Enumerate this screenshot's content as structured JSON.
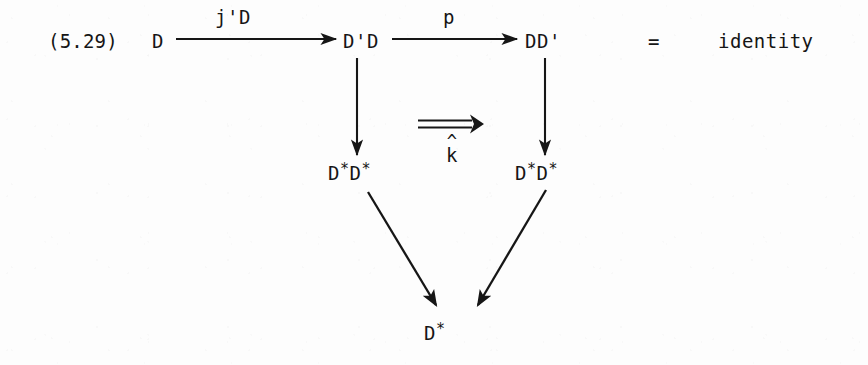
{
  "document": {
    "equation_number": "(5.29)",
    "relation_symbol": "=",
    "relation_value": "identity",
    "background_color": "#fdfdfd",
    "ink_color": "#161616"
  },
  "diagram": {
    "type": "commutative-diagram",
    "objects": [
      {
        "id": "top-left",
        "text": "D",
        "x": 152,
        "y": 43
      },
      {
        "id": "top-middle",
        "text": "D'D",
        "x": 345,
        "y": 43
      },
      {
        "id": "top-right",
        "text": "DD'",
        "x": 527,
        "y": 43
      },
      {
        "id": "middle-left",
        "text": "D",
        "star1": "*",
        "text2": "D",
        "star2": "*",
        "x": 330,
        "y": 174
      },
      {
        "id": "middle-right",
        "text": "D",
        "star1": "*",
        "text2": "D",
        "star2": "*",
        "x": 517,
        "y": 174
      },
      {
        "id": "bottom-center",
        "text": "D",
        "star1": "*",
        "x": 428,
        "y": 334
      }
    ],
    "arrow_labels": [
      {
        "id": "j-prime-D",
        "text": "j'D",
        "x": 228,
        "y": 18
      },
      {
        "id": "p",
        "text": "p",
        "x": 448,
        "y": 18
      },
      {
        "id": "k-hat",
        "hat": "^",
        "text": "k",
        "x": 448,
        "y": 152
      }
    ],
    "arrows": [
      {
        "id": "arrow-top-left-to-middle",
        "kind": "single",
        "x1": 176,
        "y1": 39,
        "x2": 337,
        "y2": 39
      },
      {
        "id": "arrow-top-middle-to-right",
        "kind": "single",
        "x1": 390,
        "y1": 39,
        "x2": 518,
        "y2": 39
      },
      {
        "id": "arrow-down-left",
        "kind": "single",
        "x1": 357,
        "y1": 58,
        "x2": 357,
        "y2": 156
      },
      {
        "id": "arrow-down-right",
        "kind": "single",
        "x1": 545,
        "y1": 58,
        "x2": 545,
        "y2": 156
      },
      {
        "id": "arrow-double-k-hat",
        "kind": "double",
        "x1": 418,
        "y1": 124,
        "x2": 480,
        "y2": 124
      },
      {
        "id": "arrow-diagonal-left",
        "kind": "single",
        "x1": 368,
        "y1": 192,
        "x2": 437,
        "y2": 307
      },
      {
        "id": "arrow-diagonal-right",
        "kind": "single",
        "x1": 546,
        "y1": 190,
        "x2": 477,
        "y2": 307
      }
    ]
  }
}
